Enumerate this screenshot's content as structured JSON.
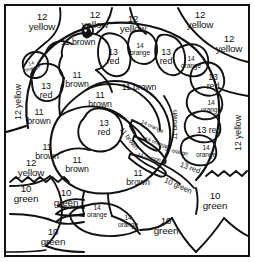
{
  "page": {
    "kind": "color-by-number-coloring-page",
    "background_color": "#ffffff",
    "line_color": "#111111",
    "border": "rectangular double frame"
  },
  "legend": {
    "pairs": [
      {
        "number": "10",
        "color_word": "green"
      },
      {
        "number": "11",
        "color_word": "brown"
      },
      {
        "number": "12",
        "color_word": "yellow"
      },
      {
        "number": "13",
        "color_word": "red"
      },
      {
        "number": "14",
        "color_word": "orange"
      }
    ]
  },
  "regions": [
    {
      "id": "bg-top-1",
      "num": "12",
      "word": "yellow",
      "text": "12\nyellow",
      "x": 42,
      "y": 22,
      "rot": 0,
      "size": "s11",
      "group": "background"
    },
    {
      "id": "bg-top-2",
      "num": "12",
      "word": "yellow",
      "text": "12\nyellow",
      "x": 95,
      "y": 20,
      "rot": 0,
      "size": "s11",
      "group": "background"
    },
    {
      "id": "bg-top-3",
      "num": "12",
      "word": "yellow",
      "text": "12\nyellow",
      "x": 133,
      "y": 24,
      "rot": 0,
      "size": "s11",
      "group": "background"
    },
    {
      "id": "bg-top-4",
      "num": "12",
      "word": "yellow",
      "text": "12\nyellow",
      "x": 200,
      "y": 20,
      "rot": 0,
      "size": "s11",
      "group": "background"
    },
    {
      "id": "bg-top-5",
      "num": "12",
      "word": "yellow",
      "text": "12\nyellow",
      "x": 229,
      "y": 44,
      "rot": 0,
      "size": "s11",
      "group": "background"
    },
    {
      "id": "bg-left-vert",
      "num": "12",
      "word": "yellow",
      "text": "12 yellow",
      "x": 18,
      "y": 102,
      "rot": -90,
      "size": "s10",
      "group": "background"
    },
    {
      "id": "bg-right-vert",
      "num": "12",
      "word": "yellow",
      "text": "12 yellow",
      "x": 238,
      "y": 133,
      "rot": -90,
      "size": "s10",
      "group": "background"
    },
    {
      "id": "bg-left-low",
      "num": "12",
      "word": "yellow",
      "text": "12\nyellow",
      "x": 31,
      "y": 168,
      "rot": 0,
      "size": "s11",
      "group": "background"
    },
    {
      "id": "feather-l-orange",
      "num": "14",
      "word": "orange",
      "text": "14\norange",
      "x": 32,
      "y": 66,
      "rot": -16,
      "size": "s6",
      "group": "feathers"
    },
    {
      "id": "feather-l-red",
      "num": "13",
      "word": "red",
      "text": "13\nred",
      "x": 46,
      "y": 91,
      "rot": 0,
      "size": "s10",
      "group": "feathers"
    },
    {
      "id": "feather-t-red1",
      "num": "13",
      "word": "red",
      "text": "13\nred",
      "x": 113,
      "y": 57,
      "rot": 0,
      "size": "s10",
      "group": "feathers"
    },
    {
      "id": "feather-t-orange1",
      "num": "14",
      "word": "orange",
      "text": "14\norange",
      "x": 140,
      "y": 50,
      "rot": 0,
      "size": "s8",
      "group": "feathers"
    },
    {
      "id": "feather-t-red2",
      "num": "13",
      "word": "red",
      "text": "13\nred",
      "x": 166,
      "y": 57,
      "rot": 0,
      "size": "s10",
      "group": "feathers"
    },
    {
      "id": "feather-r-orange1",
      "num": "14",
      "word": "orange",
      "text": "14\norange",
      "x": 191,
      "y": 63,
      "rot": 0,
      "size": "s8",
      "group": "feathers"
    },
    {
      "id": "feather-r-red1",
      "num": "13",
      "word": "red",
      "text": "13\nred",
      "x": 213,
      "y": 82,
      "rot": 0,
      "size": "s10",
      "group": "feathers"
    },
    {
      "id": "feather-r-orange2",
      "num": "14",
      "word": "orange",
      "text": "14\norange",
      "x": 211,
      "y": 107,
      "rot": 0,
      "size": "s8",
      "group": "feathers"
    },
    {
      "id": "feather-r-red2",
      "num": "13",
      "word": "red",
      "text": "13 red",
      "x": 209,
      "y": 130,
      "rot": 0,
      "size": "s10",
      "group": "feathers"
    },
    {
      "id": "feather-r-orange3",
      "num": "14",
      "word": "orange",
      "text": "14\norange",
      "x": 206,
      "y": 152,
      "rot": 0,
      "size": "s8",
      "group": "feathers"
    },
    {
      "id": "body-head",
      "num": "11",
      "word": "brown",
      "text": "11 brown",
      "x": 78,
      "y": 42,
      "rot": 0,
      "size": "s10",
      "group": "body"
    },
    {
      "id": "body-neck",
      "num": "11",
      "word": "brown",
      "text": "11\nbrown",
      "x": 77,
      "y": 80,
      "rot": 0,
      "size": "s10",
      "group": "body"
    },
    {
      "id": "body-left-1",
      "num": "11",
      "word": "brown",
      "text": "11\nbrown",
      "x": 39,
      "y": 117,
      "rot": 0,
      "size": "s10",
      "group": "body"
    },
    {
      "id": "body-left-2",
      "num": "11",
      "word": "brown",
      "text": "11\nbrown",
      "x": 47,
      "y": 152,
      "rot": 0,
      "size": "s10",
      "group": "body"
    },
    {
      "id": "body-upper",
      "num": "11",
      "word": "brown",
      "text": "11 brown",
      "x": 139,
      "y": 87,
      "rot": 0,
      "size": "s10",
      "group": "body"
    },
    {
      "id": "body-mid",
      "num": "11",
      "word": "brown",
      "text": "11\nbrown",
      "x": 100,
      "y": 100,
      "rot": 0,
      "size": "s10",
      "group": "body"
    },
    {
      "id": "body-right-vert",
      "num": "11",
      "word": "brown",
      "text": "11 brown",
      "x": 175,
      "y": 125,
      "rot": -90,
      "size": "s9",
      "group": "body"
    },
    {
      "id": "body-breast",
      "num": "13",
      "word": "red",
      "text": "13\nred",
      "x": 104,
      "y": 128,
      "rot": 0,
      "size": "s10",
      "group": "body"
    },
    {
      "id": "body-wing-diag",
      "num": "11",
      "word": "brown",
      "text": "11 brown",
      "x": 129,
      "y": 139,
      "rot": 52,
      "size": "s8",
      "group": "body"
    },
    {
      "id": "body-low-left",
      "num": "11",
      "word": "brown",
      "text": "11\nbrown",
      "x": 77,
      "y": 165,
      "rot": 0,
      "size": "s10",
      "group": "body"
    },
    {
      "id": "body-low-right",
      "num": "11",
      "word": "brown",
      "text": "11\nbrown",
      "x": 138,
      "y": 178,
      "rot": 0,
      "size": "s10",
      "group": "body"
    },
    {
      "id": "wing-orange-1",
      "num": "14",
      "word": "orange",
      "text": "14 orange",
      "x": 152,
      "y": 127,
      "rot": 25,
      "size": "s7",
      "group": "wing"
    },
    {
      "id": "wing-orange-2",
      "num": "14",
      "word": "orange",
      "text": "14 orange",
      "x": 156,
      "y": 143,
      "rot": 20,
      "size": "s7",
      "group": "wing"
    },
    {
      "id": "wing-orange-3",
      "num": "14",
      "word": "orange",
      "text": "14 orange",
      "x": 149,
      "y": 158,
      "rot": 14,
      "size": "s7",
      "group": "wing"
    },
    {
      "id": "wing-orange-4",
      "num": "14",
      "word": "orange",
      "text": "14 orange",
      "x": 176,
      "y": 152,
      "rot": 12,
      "size": "s7",
      "group": "wing"
    },
    {
      "id": "tail-red-diag",
      "num": "13",
      "word": "red",
      "text": "13 red",
      "x": 190,
      "y": 168,
      "rot": 20,
      "size": "s9",
      "group": "wing"
    },
    {
      "id": "grass-diag",
      "num": "10",
      "word": "green",
      "text": "10 green",
      "x": 178,
      "y": 186,
      "rot": 24,
      "size": "s9",
      "group": "ground"
    },
    {
      "id": "feet-orange-1",
      "num": "14",
      "word": "orange",
      "text": "14\norange",
      "x": 97,
      "y": 212,
      "rot": 0,
      "size": "s8",
      "group": "feet"
    },
    {
      "id": "feet-orange-2",
      "num": "14",
      "word": "orange",
      "text": "14\norange",
      "x": 128,
      "y": 222,
      "rot": 0,
      "size": "s8",
      "group": "feet"
    },
    {
      "id": "ground-1",
      "num": "10",
      "word": "green",
      "text": "10\ngreen",
      "x": 26,
      "y": 194,
      "rot": 0,
      "size": "s11",
      "group": "ground"
    },
    {
      "id": "ground-2",
      "num": "10",
      "word": "green",
      "text": "10\ngreen",
      "x": 66,
      "y": 198,
      "rot": 0,
      "size": "s11",
      "group": "ground"
    },
    {
      "id": "ground-3",
      "num": "10",
      "word": "green",
      "text": "10\ngreen",
      "x": 53,
      "y": 237,
      "rot": 0,
      "size": "s11",
      "group": "ground"
    },
    {
      "id": "ground-4",
      "num": "10",
      "word": "green",
      "text": "10\ngreen",
      "x": 166,
      "y": 226,
      "rot": 0,
      "size": "s11",
      "group": "ground"
    },
    {
      "id": "ground-5",
      "num": "10",
      "word": "green",
      "text": "10\ngreen",
      "x": 215,
      "y": 201,
      "rot": 0,
      "size": "s11",
      "group": "ground"
    }
  ]
}
